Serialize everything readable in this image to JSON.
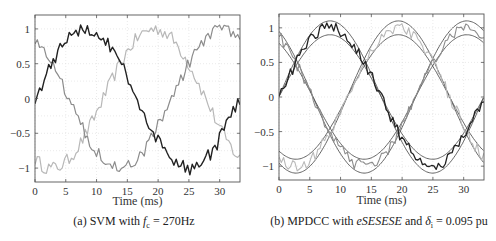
{
  "chart_data": [
    {
      "id": "a",
      "type": "line",
      "caption": {
        "prefix": "(a) SVM with ",
        "var": "f",
        "sub": "c",
        "rest": " = 270Hz"
      },
      "xlabel": "Time (ms)",
      "ylabel": "",
      "xlim": [
        0,
        33.3
      ],
      "ylim": [
        -1.2,
        1.2
      ],
      "xticks": [
        0,
        5,
        10,
        15,
        20,
        25,
        30
      ],
      "yticks": [
        1,
        0.5,
        0,
        -0.5,
        -1
      ],
      "ytick_labels": [
        "1",
        "0.5",
        "0",
        "−0.5",
        "−1"
      ],
      "grid": true,
      "fundamental_period_ms": 33.3,
      "series": [
        {
          "name": "phase-a",
          "color": "#222222",
          "width": 1.4,
          "peak_ms": 8.3,
          "amplitude": 1.0,
          "ripple": 0.1
        },
        {
          "name": "phase-b",
          "color": "#8c8c8c",
          "width": 1.2,
          "peak_ms": 30.5,
          "amplitude": 1.0,
          "ripple": 0.1
        },
        {
          "name": "phase-c",
          "color": "#b8b8b8",
          "width": 1.2,
          "peak_ms": 19.4,
          "amplitude": 1.0,
          "ripple": 0.1
        }
      ],
      "sample_points": {
        "t_ms": [
          0,
          2.5,
          5,
          7.5,
          8.3,
          10,
          12.5,
          15,
          17.5,
          20,
          22.5,
          25,
          27.5,
          30,
          33.3
        ],
        "phase-a": [
          0.0,
          0.5,
          0.85,
          0.98,
          1.08,
          0.95,
          0.6,
          0.25,
          -0.15,
          -0.55,
          -0.85,
          -1.05,
          -0.9,
          -0.5,
          0.0
        ],
        "phase-b": [
          0.9,
          0.55,
          0.15,
          -0.35,
          -0.45,
          -0.7,
          -0.95,
          -1.05,
          -0.8,
          -0.45,
          0.0,
          0.45,
          0.75,
          1.0,
          0.85
        ],
        "phase-c": [
          -0.9,
          -1.05,
          -0.95,
          -0.7,
          -0.5,
          -0.2,
          0.35,
          0.75,
          1.0,
          1.05,
          0.85,
          0.5,
          0.1,
          -0.45,
          -0.85
        ]
      }
    },
    {
      "id": "b",
      "type": "line",
      "caption": {
        "prefix": "(b) MPDCC with ",
        "seq": "eSESESE",
        "mid": " and ",
        "var": "δ",
        "sub": "i",
        "rest": " = 0.095 pu"
      },
      "xlabel": "Time (ms)",
      "ylabel": "",
      "xlim": [
        0,
        33.3
      ],
      "ylim": [
        -1.2,
        1.2
      ],
      "xticks": [
        0,
        5,
        10,
        15,
        20,
        25,
        30
      ],
      "yticks": [
        1,
        0.5,
        0,
        -0.5,
        -1
      ],
      "ytick_labels": [
        "1",
        "0.5",
        "0",
        "−0.5",
        "−1"
      ],
      "grid": true,
      "fundamental_period_ms": 33.3,
      "bound_width_pu": 0.095,
      "bound_color": "#555555",
      "series": [
        {
          "name": "phase-a",
          "color": "#222222",
          "width": 1.3,
          "peak_ms": 8.3,
          "amplitude": 1.0,
          "ripple": 0.09
        },
        {
          "name": "phase-b",
          "color": "#8c8c8c",
          "width": 1.1,
          "peak_ms": 30.5,
          "amplitude": 1.0,
          "ripple": 0.09
        },
        {
          "name": "phase-c",
          "color": "#b8b8b8",
          "width": 1.1,
          "peak_ms": 19.4,
          "amplitude": 1.0,
          "ripple": 0.09
        }
      ],
      "bounds": [
        {
          "name": "phase-a-upper",
          "peak_ms": 8.3,
          "amplitude": 1.1
        },
        {
          "name": "phase-a-lower",
          "peak_ms": 8.3,
          "amplitude": 0.9
        },
        {
          "name": "phase-b-upper",
          "peak_ms": 30.5,
          "amplitude": 1.1
        },
        {
          "name": "phase-b-lower",
          "peak_ms": 30.5,
          "amplitude": 0.9
        },
        {
          "name": "phase-c-upper",
          "peak_ms": 19.4,
          "amplitude": 1.1
        },
        {
          "name": "phase-c-lower",
          "peak_ms": 19.4,
          "amplitude": 0.9
        }
      ]
    }
  ]
}
